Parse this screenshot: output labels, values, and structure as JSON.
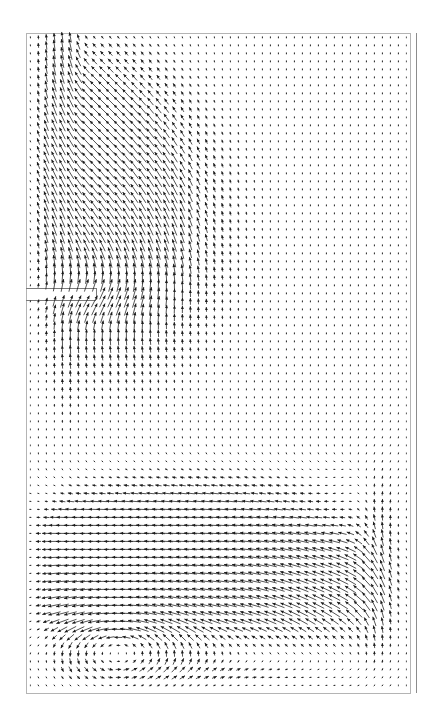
{
  "figure": {
    "title": "Velocity vector field",
    "caption": "Computed velocity vector field in a rectangular cavity with a thin horizontal inlet slot on the left wall and an outlet at the upper left.",
    "width": 427,
    "height": 716,
    "background_color": "#ffffff"
  },
  "plot_frame": {
    "domain_left": 26,
    "domain_top": 33,
    "domain_right": 410,
    "domain_bottom": 693,
    "border_color": "#b4b4b4",
    "border_width": 1,
    "outer_rule_x": 416,
    "outer_rule_top": 33,
    "outer_rule_bottom": 693,
    "outer_rule_color": "#8c8c8c",
    "name": "plot-domain-border"
  },
  "geometry": {
    "slot": {
      "label": "inlet-slot",
      "x0": 26,
      "y0": 288,
      "x1": 96,
      "y1": 300,
      "line_color": "#7a7a7a",
      "line_width": 1
    }
  },
  "vectors": {
    "glyph": "arrow",
    "color": "#1a1a1a",
    "grid_spacing_px": 8,
    "head_length_px": 3.2,
    "head_half_width_px": 1.5,
    "min_length_px": 2,
    "max_length_px": 13,
    "line_width": 0.75
  },
  "chart_data": {
    "type": "quiver",
    "title": "Velocity vector field",
    "xlabel": "",
    "ylabel": "",
    "xlim": [
      0,
      1
    ],
    "ylim": [
      0,
      1
    ],
    "grid": false,
    "legend": "none",
    "annotations": [],
    "domain_px": {
      "x0": 26,
      "y0": 33,
      "x1": 410,
      "y1": 693
    },
    "grid_nx": 48,
    "grid_ny": 83,
    "flow_features": [
      {
        "name": "inlet-jet",
        "description": "Thin horizontal slot on the left wall injects fluid rightward into the cavity.",
        "center_px": [
          96,
          294
        ],
        "direction_deg": 0,
        "strength": 1.0
      },
      {
        "name": "upward-plume",
        "description": "Jet turns upward and rises along the left half of the cavity toward the outlet.",
        "center_px": [
          110,
          200
        ],
        "direction_deg": 115,
        "strength": 0.9
      },
      {
        "name": "outlet-column",
        "description": "Two strong upward columns adjacent to the left wall exit through the top boundary.",
        "center_px": [
          40,
          160
        ],
        "direction_deg": 90,
        "strength": 1.0
      },
      {
        "name": "upper-uniform-rise",
        "description": "Weak, nearly uniform upward drift fills the upper right two-thirds of the cavity.",
        "center_px": [
          280,
          250
        ],
        "direction_deg": 90,
        "strength": 0.18
      },
      {
        "name": "return-jet",
        "description": "Strong leftward return flow band across the lower-middle of the cavity.",
        "center_px": [
          200,
          575
        ],
        "direction_deg": 180,
        "strength": 0.95
      },
      {
        "name": "right-wall-upflow",
        "description": "Fluid sweeps up the right wall and feeds the upper uniform rise.",
        "center_px": [
          395,
          560
        ],
        "direction_deg": 100,
        "strength": 0.55
      },
      {
        "name": "lower-left-vortex",
        "description": "Large clockwise recirculation eddy occupying the lower-left quadrant.",
        "center_px": [
          118,
          648
        ],
        "rotation": "clockwise",
        "radius_px": 75,
        "strength": 0.7
      },
      {
        "name": "bottom-outflow",
        "description": "Rightward drift along the bottom boundary beneath the eddy.",
        "center_px": [
          260,
          683
        ],
        "direction_deg": 0,
        "strength": 0.25
      }
    ]
  }
}
